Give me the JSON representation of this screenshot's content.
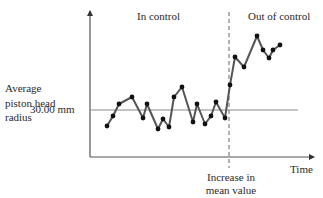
{
  "chart_data": {
    "type": "line",
    "title": "",
    "xlabel": "Time",
    "ylabel": "Average piston head radius",
    "center_line": {
      "label": "30.00 mm",
      "value": 30.0
    },
    "regions": [
      {
        "label": "In control",
        "x_range": [
          1,
          17
        ]
      },
      {
        "label": "Out of control",
        "x_range": [
          18,
          25
        ]
      }
    ],
    "annotation": {
      "label": "Increase in mean value",
      "at_x": 17.5,
      "style": "dashed vertical line"
    },
    "x": [
      1,
      2,
      3,
      4,
      5,
      6,
      7,
      8,
      9,
      10,
      11,
      12,
      13,
      14,
      15,
      16,
      17,
      18,
      19,
      20,
      21,
      22,
      23,
      24,
      25
    ],
    "y_relative_to_center": [
      -16,
      -6,
      6,
      13,
      -8,
      6,
      -19,
      -9,
      -17,
      13,
      23,
      -12,
      6,
      -14,
      -6,
      8,
      -8,
      25,
      53,
      43,
      74,
      60,
      52,
      60,
      65
    ],
    "y_units": "arbitrary (pixel offset above 30.00 mm center line; no numeric scale shown)",
    "grid": false,
    "legend": null
  },
  "labels": {
    "ylabel": "Average piston head radius",
    "center_line": "30.00 mm",
    "region_in": "In control",
    "region_out": "Out of control",
    "xlabel": "Time",
    "annotation": "Increase in mean value"
  },
  "plot": {
    "origin_px": [
      90,
      157
    ],
    "center_line_y_px": 110,
    "shift_x_px": 229,
    "points_px": [
      [
        107,
        126
      ],
      [
        113,
        116
      ],
      [
        119,
        104
      ],
      [
        132,
        97
      ],
      [
        143,
        118
      ],
      [
        147,
        104
      ],
      [
        158,
        129
      ],
      [
        163,
        119
      ],
      [
        169,
        127
      ],
      [
        174,
        97
      ],
      [
        182,
        87
      ],
      [
        193,
        122
      ],
      [
        197,
        104
      ],
      [
        205,
        124
      ],
      [
        211,
        116
      ],
      [
        216,
        102
      ],
      [
        225,
        118
      ],
      [
        230,
        85
      ],
      [
        235,
        57
      ],
      [
        244,
        67
      ],
      [
        257,
        36
      ],
      [
        263,
        50
      ],
      [
        269,
        58
      ],
      [
        273,
        50
      ],
      [
        280,
        45
      ]
    ],
    "colors": {
      "axis": "#555555",
      "center_line": "#8a8a8a",
      "series_line": "#555555",
      "marker": "#111111",
      "dashed": "#666666"
    }
  }
}
